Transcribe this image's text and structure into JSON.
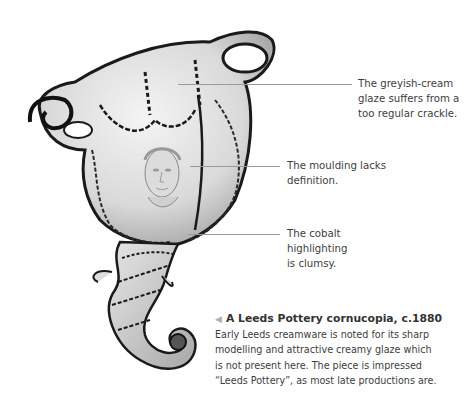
{
  "figure": {
    "alt": "Cream-glazed cornucopia with cobalt highlighting and a moulded female mask"
  },
  "annotations": [
    {
      "text_lines": [
        "The greyish-cream",
        "glaze suffers from a",
        "too regular crackle."
      ]
    },
    {
      "text_lines": [
        "The moulding lacks",
        "definition."
      ]
    },
    {
      "text_lines": [
        "The cobalt",
        "highlighting",
        "is clumsy."
      ]
    }
  ],
  "caption": {
    "arrow_icon": "◀",
    "title": "A Leeds Pottery cornucopia, c.1880",
    "body_lines": [
      "Early Leeds creamware is noted for its sharp",
      "modelling and attractive creamy glaze which",
      "is not present here. The piece is impressed",
      "“Leeds Pottery”, as most late productions are."
    ]
  }
}
